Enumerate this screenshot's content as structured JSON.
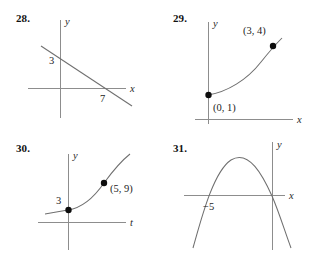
{
  "page": {
    "background_color": "#ffffff",
    "ink_color": "#1a1a1a",
    "axis_color": "#8d8d8d",
    "curve_color": "#6f6f6f"
  },
  "problems": [
    {
      "number": "28.",
      "graph_type": "line",
      "x_axis_label": "x",
      "y_axis_label": "y",
      "y_intercept_label": "3",
      "x_intercept_label": "7",
      "point_labels": [],
      "description": "decreasing straight line crossing y-axis at 3 and x-axis at 7"
    },
    {
      "number": "29.",
      "graph_type": "exponential-curve",
      "x_axis_label": "x",
      "y_axis_label": "y",
      "point_labels": [
        "(3, 4)",
        "(0, 1)"
      ],
      "points": [
        {
          "label": "(0, 1)",
          "x": 0,
          "y": 1
        },
        {
          "label": "(3, 4)",
          "x": 3,
          "y": 4
        }
      ],
      "description": "increasing curve through (0,1) and (3,4)"
    },
    {
      "number": "30.",
      "graph_type": "exponential-curve",
      "x_axis_label": "t",
      "y_axis_label": "y",
      "y_intercept_label": "3",
      "point_labels": [
        "(5, 9)"
      ],
      "points": [
        {
          "label": "3",
          "x": 0,
          "y": 3
        },
        {
          "label": "(5, 9)",
          "x": 5,
          "y": 9
        }
      ],
      "description": "increasing curve with y-intercept 3 passing through (5,9), horizontal axis labeled t"
    },
    {
      "number": "31.",
      "graph_type": "parabola",
      "x_axis_label": "x",
      "y_axis_label": "y",
      "x_intercept_label": "−5",
      "point_labels": [],
      "description": "downward-opening parabola with left x-intercept at -5"
    }
  ]
}
